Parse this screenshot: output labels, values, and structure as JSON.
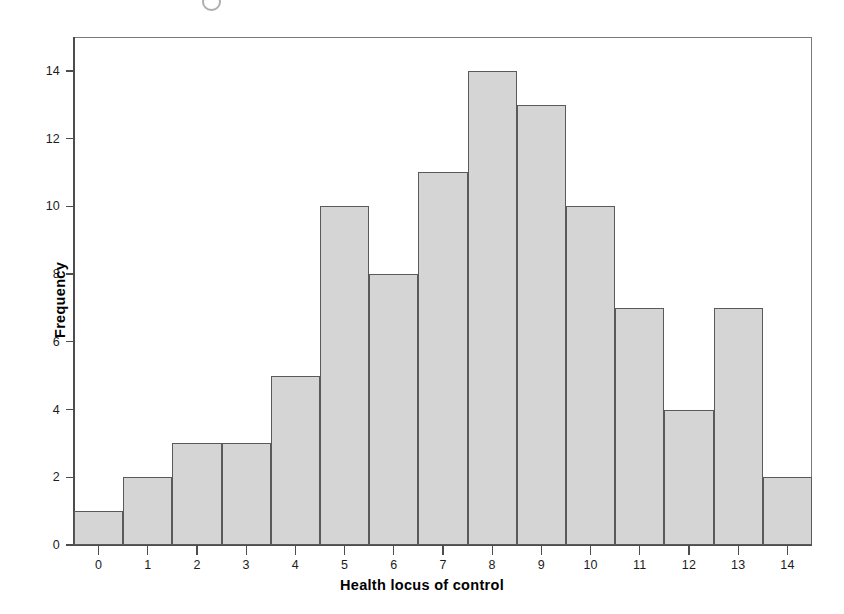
{
  "chart_data": {
    "type": "bar",
    "title": "",
    "subtitle": "",
    "xlabel": "Health locus of control",
    "ylabel": "Frequency",
    "categories": [
      "0",
      "1",
      "2",
      "3",
      "4",
      "5",
      "6",
      "7",
      "8",
      "9",
      "10",
      "11",
      "12",
      "13",
      "14"
    ],
    "values": [
      1,
      2,
      3,
      3,
      5,
      10,
      8,
      11,
      14,
      13,
      10,
      7,
      4,
      7,
      2
    ],
    "x": [
      0,
      1,
      2,
      3,
      4,
      5,
      6,
      7,
      8,
      9,
      10,
      11,
      12,
      13,
      14
    ],
    "xlim": [
      -0.5,
      14.5
    ],
    "ylim": [
      0,
      15
    ],
    "yticks": [
      0,
      2,
      4,
      6,
      8,
      10,
      12,
      14
    ],
    "ytick_labels": [
      "0",
      "2",
      "4",
      "6",
      "8",
      "10",
      "12",
      "14"
    ],
    "xticks": [
      0,
      1,
      2,
      3,
      4,
      5,
      6,
      7,
      8,
      9,
      10,
      11,
      12,
      13,
      14
    ],
    "xtick_labels": [
      "0",
      "1",
      "2",
      "3",
      "4",
      "5",
      "6",
      "7",
      "8",
      "9",
      "10",
      "11",
      "12",
      "13",
      "14"
    ],
    "grid": false,
    "legend": null,
    "bar_fill_color": "#d5d5d5",
    "bar_edge_color": "#5a5a5a",
    "axis_color": "#4d4d4d",
    "background_color": "#ffffff",
    "bin_width": 1,
    "total_count": 90,
    "annotations": []
  },
  "figure": {
    "name": "histogram-health-locus-of-control"
  }
}
